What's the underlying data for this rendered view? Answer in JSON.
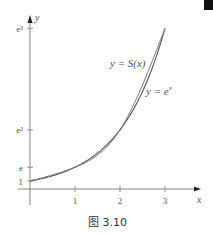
{
  "chart_data": {
    "type": "line",
    "title": "",
    "caption": "图 3.10",
    "xlabel": "x",
    "ylabel": "y",
    "xlim": [
      0,
      3.8
    ],
    "ylim": [
      0,
      21.5
    ],
    "grid": false,
    "x_ticks": [
      {
        "value": 1,
        "label": "1"
      },
      {
        "value": 2,
        "label": "2"
      },
      {
        "value": 3,
        "label": "3"
      }
    ],
    "y_ticks": [
      {
        "value": 1,
        "label": "1"
      },
      {
        "value": 2.71828,
        "label": "e"
      },
      {
        "value": 7.38906,
        "label": "e²"
      },
      {
        "value": 20.0855,
        "label": "e³"
      }
    ],
    "series": [
      {
        "name": "y = e^x",
        "label_text": "y = e",
        "label_sup": "x",
        "function": "exp",
        "x_range": [
          0,
          3
        ],
        "color": "#555555"
      },
      {
        "name": "y = S(x)",
        "label_text": "y = S(x)",
        "function": "natural_cubic_spline",
        "nodes_x": [
          0,
          1,
          2,
          3
        ],
        "nodes_y": [
          1,
          2.71828,
          7.38906,
          20.0855
        ],
        "color": "#777777"
      }
    ]
  },
  "figure": {
    "caption": "图 3.10",
    "corner_mark": true
  }
}
